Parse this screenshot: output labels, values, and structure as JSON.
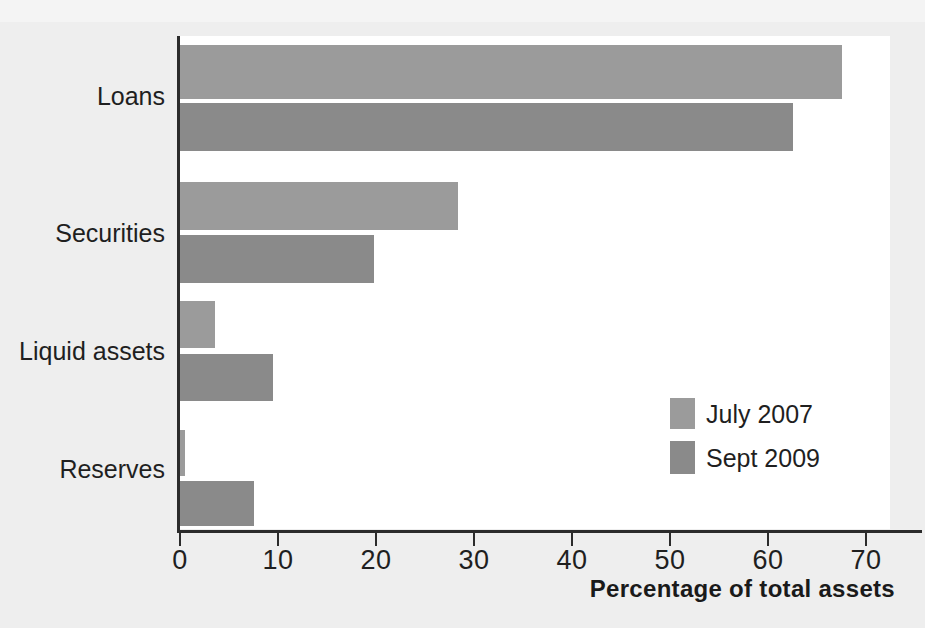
{
  "chart_data": {
    "type": "bar",
    "orientation": "horizontal",
    "title": "",
    "xlabel": "Percentage of total assets",
    "ylabel": "",
    "xlim": [
      0,
      74
    ],
    "xticks": [
      0,
      10,
      20,
      30,
      40,
      50,
      60,
      70
    ],
    "xtick_labels": [
      "0",
      "10",
      "20",
      "30",
      "40",
      "50",
      "60",
      "70"
    ],
    "grid": false,
    "legend_position": "inside-lower-right",
    "categories": [
      "Loans",
      "Securities",
      "Liquid assets",
      "Reserves"
    ],
    "series": [
      {
        "name": "July 2007",
        "color": "#9b9b9b",
        "values": [
          67.5,
          28.4,
          3.6,
          0.5
        ]
      },
      {
        "name": "Sept 2009",
        "color": "#8a8a8a",
        "values": [
          62.6,
          19.8,
          9.5,
          7.6
        ]
      }
    ]
  },
  "colors": {
    "background": "#eeeeee",
    "plot_background": "#ffffff",
    "axis": "#2b2b2b",
    "text": "#1f1f1f",
    "series_1": "#9b9b9b",
    "series_2": "#8a8a8a"
  }
}
